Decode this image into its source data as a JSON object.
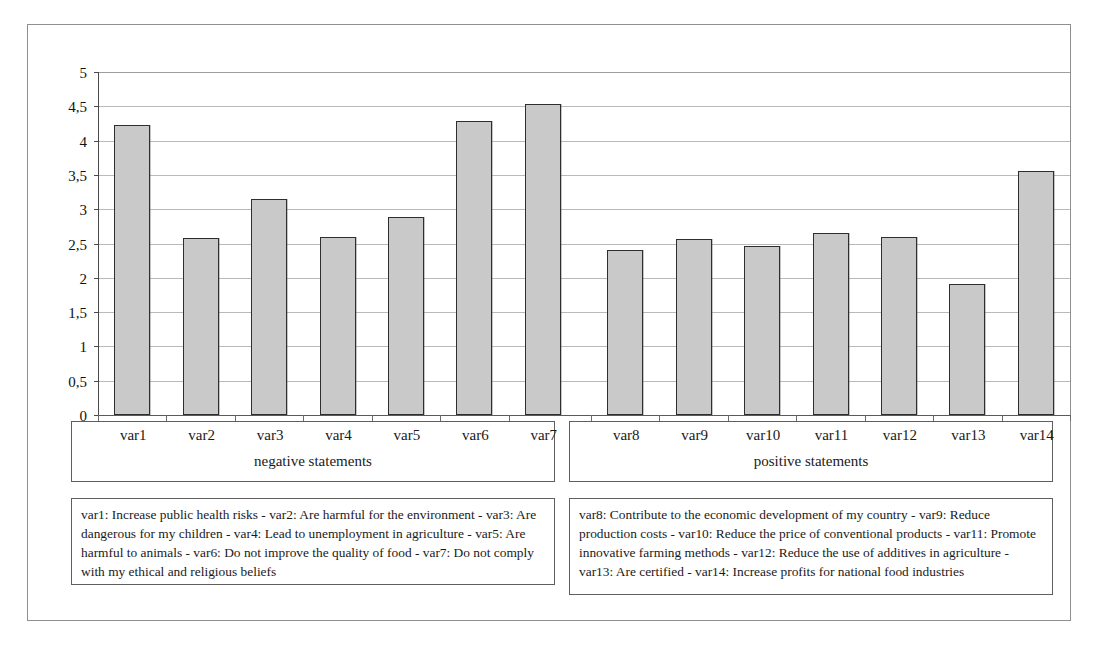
{
  "chart_data": {
    "type": "bar",
    "title": "",
    "xlabel": "",
    "ylabel": "",
    "ylim": [
      0,
      5
    ],
    "grid": true,
    "legend_position": "below-plot",
    "categories": [
      "var1",
      "var2",
      "var3",
      "var4",
      "var5",
      "var6",
      "var7",
      "var8",
      "var9",
      "var10",
      "var11",
      "var12",
      "var13",
      "var14"
    ],
    "values": [
      4.23,
      2.58,
      3.15,
      2.59,
      2.89,
      4.29,
      4.54,
      2.41,
      2.56,
      2.46,
      2.66,
      2.6,
      1.91,
      3.55
    ],
    "ytick_labels": [
      "5",
      "4,5",
      "4",
      "3,5",
      "3",
      "2,5",
      "2",
      "1,5",
      "1",
      "0,5",
      "0"
    ],
    "ytick_values": [
      5,
      4.5,
      4,
      3.5,
      3,
      2.5,
      2,
      1.5,
      1,
      0.5,
      0
    ],
    "groups": [
      {
        "name": "negative statements",
        "categories": [
          "var1",
          "var2",
          "var3",
          "var4",
          "var5",
          "var6",
          "var7"
        ]
      },
      {
        "name": "positive statements",
        "categories": [
          "var8",
          "var9",
          "var10",
          "var11",
          "var12",
          "var13",
          "var14"
        ]
      }
    ],
    "series": [
      {
        "name": "mean score",
        "values": [
          4.23,
          2.58,
          3.15,
          2.59,
          2.89,
          4.29,
          4.54,
          2.41,
          2.56,
          2.46,
          2.66,
          2.6,
          1.91,
          3.55
        ]
      }
    ]
  },
  "axis": {
    "y_labels": [
      "5",
      "4,5",
      "4",
      "3,5",
      "3",
      "2,5",
      "2",
      "1,5",
      "1",
      "0,5",
      "0"
    ]
  },
  "groups": {
    "negative": {
      "title": "negative statements",
      "categories": [
        "var1",
        "var2",
        "var3",
        "var4",
        "var5",
        "var6",
        "var7"
      ]
    },
    "positive": {
      "title": "positive statements",
      "categories": [
        "var8",
        "var9",
        "var10",
        "var11",
        "var12",
        "var13",
        "var14"
      ]
    }
  },
  "legend": {
    "negative_text": "var1: Increase public health risks - var2: Are harmful for the environment - var3: Are dangerous for my children - var4: Lead to unemployment in agriculture - var5: Are harmful to animals - var6: Do not improve the quality of food - var7: Do not comply with my ethical and religious beliefs",
    "positive_text": "var8: Contribute to the economic development of my country - var9: Reduce production costs - var10: Reduce the price of conventional products - var11: Promote innovative farming methods - var12: Reduce the use of additives in agriculture - var13: Are certified - var14: Increase profits for national food industries"
  },
  "style": {
    "bar_fill": "#c9c9c9",
    "bar_border": "#2e2e2e",
    "grid_color": "#b9b9b9",
    "frame_color": "#8f8f8f",
    "text_color": "#1a1a1a"
  }
}
